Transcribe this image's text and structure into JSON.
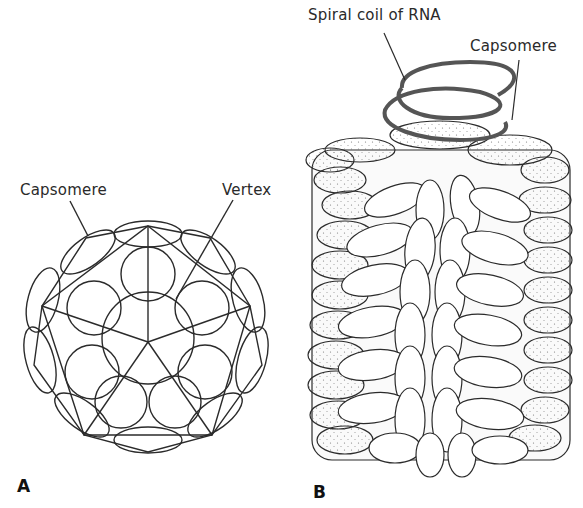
{
  "figure": {
    "panels": [
      {
        "id": "A",
        "letter": "A",
        "description": "Icosahedral capsid",
        "labels": {
          "capsomere": "Capsomere",
          "vertex": "Vertex"
        }
      },
      {
        "id": "B",
        "letter": "B",
        "description": "Helical capsid",
        "labels": {
          "rna": "Spiral coil of RNA",
          "capsomere": "Capsomere"
        }
      }
    ],
    "colors": {
      "line": "#2b2b2b",
      "rna_coil": "#555555",
      "background": "#ffffff",
      "stipple": "#777777"
    }
  }
}
